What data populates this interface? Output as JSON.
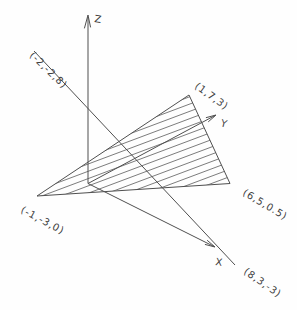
{
  "diagram": {
    "kind": "3d-line-plane-intersection-figure",
    "axes": {
      "x": "X",
      "y": "Y",
      "z": "Z"
    },
    "points": {
      "line_start": "(-2,-2,8)",
      "triangle_top": "(1,7,3)",
      "triangle_right": "(6,5,0.5)",
      "triangle_left": "(-1,-3,0)",
      "line_end": "(8,3,-3)"
    },
    "colors": {
      "background": "#fefefe",
      "line": "#4f4f4f",
      "hatch": "#5a5a5a",
      "text": "#3f3f3f"
    }
  }
}
